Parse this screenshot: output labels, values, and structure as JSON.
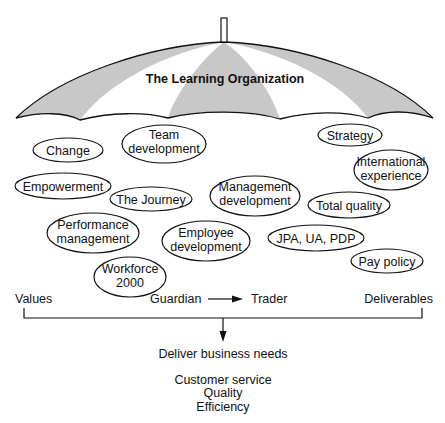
{
  "umbrella": {
    "title": "The Learning Organization",
    "shade_color": "#c8c8c8"
  },
  "bubbles": [
    {
      "id": "change",
      "lines": [
        "Change"
      ]
    },
    {
      "id": "team-development",
      "lines": [
        "Team",
        "development"
      ]
    },
    {
      "id": "strategy",
      "lines": [
        "Strategy"
      ]
    },
    {
      "id": "international-experience",
      "lines": [
        "International",
        "experience"
      ]
    },
    {
      "id": "empowerment",
      "lines": [
        "Empowerment"
      ]
    },
    {
      "id": "the-journey",
      "lines": [
        "The Journey"
      ]
    },
    {
      "id": "management-development",
      "lines": [
        "Management",
        "development"
      ]
    },
    {
      "id": "total-quality",
      "lines": [
        "Total quality"
      ]
    },
    {
      "id": "performance-management",
      "lines": [
        "Performance",
        "management"
      ]
    },
    {
      "id": "employee-development",
      "lines": [
        "Employee",
        "development"
      ]
    },
    {
      "id": "jpa-ua-pdp",
      "lines": [
        "JPA, UA, PDP"
      ]
    },
    {
      "id": "pay-policy",
      "lines": [
        "Pay policy"
      ]
    },
    {
      "id": "workforce-2000",
      "lines": [
        "Workforce",
        "2000"
      ]
    }
  ],
  "bottom": {
    "values": "Values",
    "guardian": "Guardian",
    "trader": "Trader",
    "deliverables": "Deliverables",
    "deliver": "Deliver business needs",
    "outcomes": [
      "Customer service",
      "Quality",
      "Efficiency"
    ]
  }
}
